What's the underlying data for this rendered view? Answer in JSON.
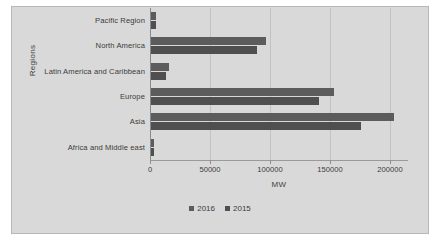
{
  "chart_data": {
    "type": "bar",
    "orientation": "horizontal",
    "title": "",
    "xlabel": "MW",
    "ylabel": "Regions",
    "categories": [
      "Pacific Region",
      "North America",
      "Latin America and Caribbean",
      "Europe",
      "Asia",
      "Africa and Middle east"
    ],
    "series": [
      {
        "name": "2016",
        "color": "#5c5c5c",
        "values": [
          5300,
          97000,
          16000,
          153000,
          203000,
          3400
        ]
      },
      {
        "name": "2015",
        "color": "#4f4f4f",
        "values": [
          5100,
          89000,
          13000,
          141000,
          176000,
          3000
        ]
      }
    ],
    "xlim": [
      0,
      215000
    ],
    "xticks": [
      0,
      50000,
      100000,
      150000,
      200000
    ],
    "xtick_labels": [
      "0",
      "50000",
      "100000",
      "150000",
      "200000"
    ],
    "grid": true,
    "legend_position": "bottom",
    "legend_entries": [
      "2016",
      "2015"
    ]
  }
}
